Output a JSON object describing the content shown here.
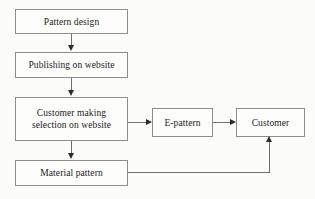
{
  "diagram": {
    "type": "flowchart",
    "background_color": "#fbfbfa",
    "node_border_color": "#8d8d8d",
    "connector_color": "#6f6f6f",
    "arrowhead_color": "#2b2b2b",
    "nodes": [
      {
        "id": "pattern-design",
        "label": "Pattern design",
        "shape": "rectangle"
      },
      {
        "id": "publishing",
        "label": "Publishing on website",
        "shape": "rectangle"
      },
      {
        "id": "customer-selection",
        "line1": "Customer making",
        "line2": "selection on website",
        "shape": "rectangle"
      },
      {
        "id": "material-pattern",
        "label": "Material pattern",
        "shape": "rectangle"
      },
      {
        "id": "epattern",
        "label": "E-pattern",
        "shape": "rectangle"
      },
      {
        "id": "customer",
        "label": "Customer",
        "shape": "rectangle"
      }
    ],
    "edges": [
      {
        "id": "e1",
        "from": "pattern-design",
        "to": "publishing",
        "direction": "down",
        "label": ""
      },
      {
        "id": "e2",
        "from": "publishing",
        "to": "customer-selection",
        "direction": "down",
        "label": ""
      },
      {
        "id": "e3",
        "from": "customer-selection",
        "to": "material-pattern",
        "direction": "down",
        "label": ""
      },
      {
        "id": "e4",
        "from": "customer-selection",
        "to": "epattern",
        "direction": "right",
        "label": ""
      },
      {
        "id": "e5",
        "from": "epattern",
        "to": "customer",
        "direction": "right",
        "label": ""
      },
      {
        "id": "e6",
        "from": "material-pattern",
        "to": "customer",
        "direction": "elbow-right-up",
        "label": ""
      }
    ]
  }
}
